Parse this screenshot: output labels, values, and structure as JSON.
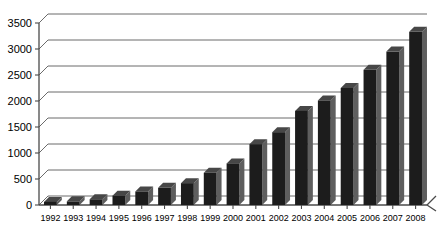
{
  "chart_data": {
    "type": "bar",
    "title": "",
    "subtitle": "",
    "xlabel": "",
    "ylabel": "",
    "categories": [
      "1992",
      "1993",
      "1994",
      "1995",
      "1996",
      "1997",
      "1998",
      "1999",
      "2000",
      "2001",
      "2002",
      "2003",
      "2004",
      "2005",
      "2006",
      "2007",
      "2008"
    ],
    "values": [
      60,
      70,
      110,
      180,
      260,
      330,
      420,
      620,
      800,
      1170,
      1400,
      1810,
      2010,
      2250,
      2600,
      2950,
      3330
    ],
    "series": [
      {
        "name": "",
        "values": [
          60,
          70,
          110,
          180,
          260,
          330,
          420,
          620,
          800,
          1170,
          1400,
          1810,
          2010,
          2250,
          2600,
          2950,
          3330
        ]
      }
    ],
    "ylim": [
      0,
      3500
    ],
    "yticks": [
      0,
      500,
      1000,
      1500,
      2000,
      2500,
      3000,
      3500
    ],
    "ytick_labels": [
      "0",
      "500",
      "1000",
      "1500",
      "2000",
      "2500",
      "3000",
      "3500"
    ],
    "grid": true,
    "grid_axis": "y",
    "legend": false,
    "legend_position": "none",
    "style": "3d-column",
    "bar_color": "#1c1c1c",
    "bar_side_color": "#5e5e5e",
    "grid_color": "#6b6b6b",
    "axis_color": "#4a4a4a",
    "background_color": "#ffffff"
  }
}
